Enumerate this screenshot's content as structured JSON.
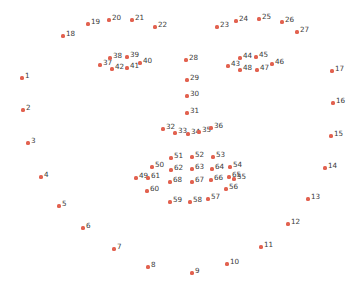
{
  "figure": {
    "title": "",
    "background_color": "#ffffff",
    "marker_color": "#e2614f",
    "label_color": "#3a3a3a",
    "width": 364,
    "height": 290
  },
  "chart_data": {
    "type": "scatter",
    "title": "",
    "xlabel": "",
    "ylabel": "",
    "xlim": [
      0,
      364
    ],
    "ylim": [
      0,
      290
    ],
    "grid": false,
    "legend": null,
    "axes_visible": false,
    "point_count": 68,
    "marker_color": "#e2614f",
    "label_color": "#3a3a3a",
    "series": [
      {
        "name": "facial-landmarks",
        "points": [
          {
            "label": "1",
            "x": 22,
            "y": 78
          },
          {
            "label": "2",
            "x": 23,
            "y": 110
          },
          {
            "label": "3",
            "x": 28,
            "y": 143
          },
          {
            "label": "4",
            "x": 41,
            "y": 177
          },
          {
            "label": "5",
            "x": 59,
            "y": 206
          },
          {
            "label": "6",
            "x": 83,
            "y": 228
          },
          {
            "label": "7",
            "x": 114,
            "y": 249
          },
          {
            "label": "8",
            "x": 148,
            "y": 267
          },
          {
            "label": "9",
            "x": 192,
            "y": 273
          },
          {
            "label": "10",
            "x": 227,
            "y": 264
          },
          {
            "label": "11",
            "x": 261,
            "y": 247
          },
          {
            "label": "12",
            "x": 288,
            "y": 224
          },
          {
            "label": "13",
            "x": 308,
            "y": 199
          },
          {
            "label": "14",
            "x": 325,
            "y": 168
          },
          {
            "label": "15",
            "x": 331,
            "y": 136
          },
          {
            "label": "16",
            "x": 333,
            "y": 103
          },
          {
            "label": "17",
            "x": 332,
            "y": 71
          },
          {
            "label": "18",
            "x": 63,
            "y": 36
          },
          {
            "label": "19",
            "x": 88,
            "y": 24
          },
          {
            "label": "20",
            "x": 109,
            "y": 20
          },
          {
            "label": "21",
            "x": 132,
            "y": 20
          },
          {
            "label": "22",
            "x": 155,
            "y": 27
          },
          {
            "label": "23",
            "x": 217,
            "y": 27
          },
          {
            "label": "24",
            "x": 236,
            "y": 21
          },
          {
            "label": "25",
            "x": 259,
            "y": 19
          },
          {
            "label": "26",
            "x": 282,
            "y": 22
          },
          {
            "label": "27",
            "x": 297,
            "y": 32
          },
          {
            "label": "28",
            "x": 186,
            "y": 60
          },
          {
            "label": "29",
            "x": 187,
            "y": 80
          },
          {
            "label": "30",
            "x": 187,
            "y": 96
          },
          {
            "label": "31",
            "x": 187,
            "y": 113
          },
          {
            "label": "32",
            "x": 163,
            "y": 129
          },
          {
            "label": "33",
            "x": 175,
            "y": 133
          },
          {
            "label": "34",
            "x": 188,
            "y": 134
          },
          {
            "label": "35",
            "x": 199,
            "y": 132
          },
          {
            "label": "36",
            "x": 211,
            "y": 128
          },
          {
            "label": "37",
            "x": 100,
            "y": 65
          },
          {
            "label": "38",
            "x": 110,
            "y": 58
          },
          {
            "label": "39",
            "x": 127,
            "y": 57
          },
          {
            "label": "40",
            "x": 140,
            "y": 63
          },
          {
            "label": "41",
            "x": 127,
            "y": 68
          },
          {
            "label": "42",
            "x": 112,
            "y": 69
          },
          {
            "label": "43",
            "x": 228,
            "y": 66
          },
          {
            "label": "44",
            "x": 240,
            "y": 58
          },
          {
            "label": "45",
            "x": 256,
            "y": 57
          },
          {
            "label": "46",
            "x": 272,
            "y": 64
          },
          {
            "label": "47",
            "x": 257,
            "y": 70
          },
          {
            "label": "48",
            "x": 240,
            "y": 70
          },
          {
            "label": "49",
            "x": 136,
            "y": 178
          },
          {
            "label": "50",
            "x": 152,
            "y": 167
          },
          {
            "label": "51",
            "x": 171,
            "y": 158
          },
          {
            "label": "52",
            "x": 192,
            "y": 157
          },
          {
            "label": "53",
            "x": 213,
            "y": 157
          },
          {
            "label": "54",
            "x": 230,
            "y": 167
          },
          {
            "label": "55",
            "x": 234,
            "y": 179
          },
          {
            "label": "56",
            "x": 226,
            "y": 189
          },
          {
            "label": "57",
            "x": 208,
            "y": 199
          },
          {
            "label": "58",
            "x": 190,
            "y": 202
          },
          {
            "label": "59",
            "x": 170,
            "y": 202
          },
          {
            "label": "60",
            "x": 147,
            "y": 191
          },
          {
            "label": "61",
            "x": 148,
            "y": 178
          },
          {
            "label": "62",
            "x": 171,
            "y": 170
          },
          {
            "label": "63",
            "x": 192,
            "y": 169
          },
          {
            "label": "64",
            "x": 212,
            "y": 169
          },
          {
            "label": "65",
            "x": 229,
            "y": 177
          },
          {
            "label": "66",
            "x": 211,
            "y": 180
          },
          {
            "label": "67",
            "x": 192,
            "y": 182
          },
          {
            "label": "68",
            "x": 170,
            "y": 182
          }
        ]
      }
    ]
  }
}
